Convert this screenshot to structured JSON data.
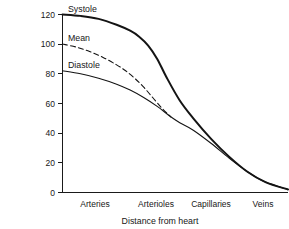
{
  "chart_data": {
    "type": "line",
    "title": "",
    "xlabel": "Distance from heart",
    "ylabel": "",
    "ylim": [
      0,
      120
    ],
    "xlim": [
      0,
      1
    ],
    "grid": false,
    "legend_position": "inline-left",
    "yticks": [
      0,
      20,
      40,
      60,
      80,
      100,
      120
    ],
    "ytick_labels": [
      "0",
      "20",
      "40",
      "60",
      "80",
      "100",
      "120"
    ],
    "categories": [
      "Arteries",
      "Arterioles",
      "Capillaries",
      "Veins"
    ],
    "category_positions": [
      0.145,
      0.415,
      0.66,
      0.89
    ],
    "series": [
      {
        "name": "Systole",
        "style": "solid-thick",
        "x": [
          0.0,
          0.08,
          0.16,
          0.24,
          0.3,
          0.34,
          0.38,
          0.42,
          0.46,
          0.52,
          0.58,
          0.66,
          0.74,
          0.82,
          0.9,
          1.0
        ],
        "values": [
          120,
          119,
          117,
          113,
          109,
          105,
          99,
          90,
          78,
          62,
          50,
          36,
          24,
          14,
          7,
          2
        ]
      },
      {
        "name": "Mean",
        "style": "dashed",
        "x": [
          0.0,
          0.06,
          0.12,
          0.18,
          0.24,
          0.28,
          0.32,
          0.36,
          0.4,
          0.44,
          0.48
        ],
        "values": [
          100,
          98,
          95,
          91,
          86,
          82,
          77,
          71,
          64,
          57,
          51
        ]
      },
      {
        "name": "Diastole",
        "style": "solid-thin",
        "x": [
          0.0,
          0.08,
          0.16,
          0.24,
          0.3,
          0.36,
          0.42,
          0.48,
          0.52,
          0.58,
          0.66,
          0.74,
          0.82,
          0.9,
          1.0
        ],
        "values": [
          82,
          80,
          77,
          73,
          69,
          64,
          58,
          51,
          47,
          42,
          33,
          23,
          14,
          7,
          2
        ]
      }
    ],
    "annotations": [
      {
        "text": "Systole",
        "value": 120
      },
      {
        "text": "Mean",
        "value": 100
      },
      {
        "text": "Diastole",
        "value": 82
      }
    ],
    "colors": {
      "line": "#141414",
      "axis": "#1a1a1a",
      "background": "#ffffff"
    }
  },
  "labels": {
    "y0": "0",
    "y20": "20",
    "y40": "40",
    "y60": "60",
    "y80": "80",
    "y100": "100",
    "y120": "120",
    "cat0": "Arteries",
    "cat1": "Arterioles",
    "cat2": "Capillaries",
    "cat3": "Veins",
    "xaxis_title": "Distance from heart",
    "series_systole": "Systole",
    "series_mean": "Mean",
    "series_diastole": "Diastole"
  }
}
